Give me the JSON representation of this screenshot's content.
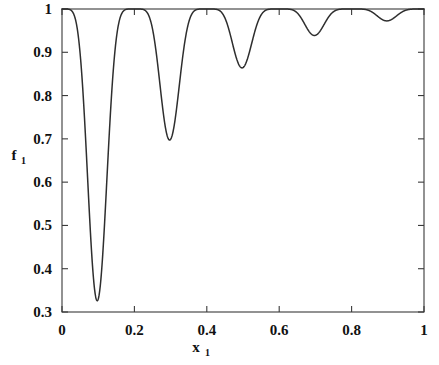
{
  "chart_data": {
    "type": "line",
    "title": "",
    "subtitle": "",
    "xlabel": "x",
    "xlabel_sub": "1",
    "ylabel": "f",
    "ylabel_sub": "1",
    "xlim": [
      0,
      1
    ],
    "ylim": [
      0.3,
      1
    ],
    "grid": false,
    "legend": null,
    "legend_position": "none",
    "x_tick_labels": [
      "0",
      "0.2",
      "0.4",
      "0.6",
      "0.8",
      "1"
    ],
    "x_tick_values": [
      0,
      0.2,
      0.4,
      0.6,
      0.8,
      1
    ],
    "y_tick_labels": [
      "0.3",
      "0.4",
      "0.5",
      "0.6",
      "0.7",
      "0.8",
      "0.9",
      "1"
    ],
    "y_tick_values": [
      0.3,
      0.4,
      0.5,
      0.6,
      0.7,
      0.8,
      0.9,
      1
    ],
    "series": [
      {
        "name": "f1",
        "color": "#2e2e2e",
        "formula": "1 - exp(-4*x)*sin(5*pi*x)^6",
        "x": [
          0.0,
          0.01,
          0.02,
          0.03,
          0.04,
          0.05,
          0.06,
          0.07,
          0.08,
          0.09,
          0.1,
          0.11,
          0.12,
          0.13,
          0.14,
          0.15,
          0.16,
          0.17,
          0.18,
          0.19,
          0.2,
          0.21,
          0.22,
          0.23,
          0.24,
          0.25,
          0.26,
          0.27,
          0.28,
          0.29,
          0.3,
          0.31,
          0.32,
          0.33,
          0.34,
          0.35,
          0.36,
          0.37,
          0.38,
          0.39,
          0.4,
          0.41,
          0.42,
          0.43,
          0.44,
          0.45,
          0.46,
          0.47,
          0.48,
          0.49,
          0.5,
          0.51,
          0.52,
          0.53,
          0.54,
          0.55,
          0.56,
          0.57,
          0.58,
          0.59,
          0.6,
          0.61,
          0.62,
          0.63,
          0.64,
          0.65,
          0.66,
          0.67,
          0.68,
          0.69,
          0.7,
          0.71,
          0.72,
          0.73,
          0.74,
          0.75,
          0.76,
          0.77,
          0.78,
          0.79,
          0.8,
          0.81,
          0.82,
          0.83,
          0.84,
          0.85,
          0.86,
          0.87,
          0.88,
          0.89,
          0.9,
          0.91,
          0.92,
          0.93,
          0.94,
          0.95,
          0.96,
          0.97,
          0.98,
          0.99,
          1.0
        ],
        "y": [
          1.0,
          1.0,
          0.9999,
          0.9992,
          0.9969,
          0.9913,
          0.9806,
          0.9632,
          0.9387,
          0.9084,
          0.8752,
          0.8434,
          0.8174,
          0.8013,
          0.7975,
          0.8067,
          0.8278,
          0.8583,
          0.895,
          0.9341,
          0.9722,
          1.0,
          1.0,
          1.0,
          0.9999,
          0.9994,
          0.9977,
          0.9938,
          0.9864,
          0.9749,
          0.9589,
          0.939,
          0.9164,
          0.8932,
          0.8716,
          0.8539,
          0.8418,
          0.8365,
          0.8384,
          0.8471,
          0.8616,
          1.0,
          1.0,
          1.0,
          1.0,
          0.9999,
          0.9997,
          0.9991,
          0.9979,
          0.9956,
          0.992,
          0.9868,
          0.9802,
          0.9726,
          0.9646,
          0.9569,
          0.9503,
          0.9456,
          0.9433,
          0.9436,
          0.9468,
          1.0,
          1.0,
          1.0,
          1.0,
          1.0,
          0.9999,
          0.9998,
          0.9996,
          0.9992,
          0.9986,
          0.9978,
          0.9968,
          0.9957,
          0.9947,
          0.9938,
          0.9932,
          0.993,
          0.9932,
          0.9939,
          0.9951,
          1.0,
          1.0,
          1.0,
          1.0,
          1.0,
          1.0,
          1.0,
          1.0,
          0.9999,
          0.9999,
          0.9998,
          0.9997,
          0.9997,
          0.9997,
          0.9997,
          0.9997,
          0.9998,
          0.9999,
          0.9999,
          1.0
        ],
        "local_minima": [
          {
            "x": 0.1,
            "y": 0.33
          },
          {
            "x": 0.3,
            "y": 0.69
          },
          {
            "x": 0.5,
            "y": 0.86
          },
          {
            "x": 0.7,
            "y": 0.9
          },
          {
            "x": 0.9,
            "y": 0.95
          }
        ],
        "maxima_x": [
          0.0,
          0.2,
          0.4,
          0.6,
          0.8,
          1.0
        ],
        "maxima_y": 1.0
      }
    ]
  },
  "style": {
    "background_color": "#ffffff",
    "axis_color": "#3a3a3a",
    "curve_color": "#2e2e2e",
    "text_color": "#111111"
  }
}
